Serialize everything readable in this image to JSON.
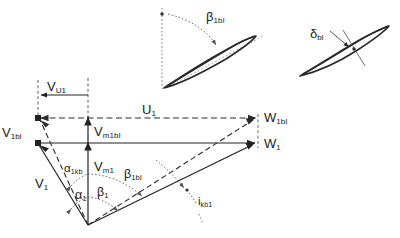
{
  "figure": {
    "colors": {
      "line": "#222222",
      "dashed": "#333333",
      "dotted": "#777777",
      "blade_outline": "#2a2a2a",
      "blade_camber": "#999999",
      "background": "#ffffff"
    }
  },
  "blade_top": {
    "angle_label": {
      "symbol": "β",
      "subscript": "1bl",
      "description": "blade inlet angle measured from meridional reference"
    },
    "reference_line": "vertical-dotted-meridional-line",
    "arc": "dotted-angle-arc",
    "profile": "thin-cambered-blade-profile",
    "camber_line": "dotted-camber-line"
  },
  "blade_right": {
    "thickness_label": {
      "symbol": "δ",
      "subscript": "bl",
      "description": "blade thickness"
    },
    "profile": "thin-cambered-blade-profile",
    "thickness_arrow": "double-headed-thickness-indicator"
  },
  "triangle": {
    "vectors": [
      {
        "name": "V_U1",
        "symbol": "V",
        "subscript": "U1",
        "description": "tangential component of absolute velocity",
        "style": "solid-arrow-left"
      },
      {
        "name": "U_1",
        "symbol": "U",
        "subscript": "1",
        "description": "blade speed at inlet",
        "style": "dashed-double-arrow"
      },
      {
        "name": "V_1bl",
        "symbol": "V",
        "subscript": "1bl",
        "description": "absolute velocity with blade blockage",
        "style": "dashed-arrow"
      },
      {
        "name": "V_1",
        "symbol": "V",
        "subscript": "1",
        "description": "absolute velocity at inlet",
        "style": "solid-arrow"
      },
      {
        "name": "V_m1bl",
        "symbol": "V",
        "subscript": "m1bl",
        "description": "meridional velocity with blade blockage",
        "style": "solid-arrow-up"
      },
      {
        "name": "V_m1",
        "symbol": "V",
        "subscript": "m1",
        "description": "meridional velocity at inlet",
        "style": "solid-arrow-up"
      },
      {
        "name": "W_1bl",
        "symbol": "W",
        "subscript": "1bl",
        "description": "relative velocity with blade blockage",
        "style": "dashed-arrow"
      },
      {
        "name": "W_1",
        "symbol": "W",
        "subscript": "1",
        "description": "relative velocity at inlet",
        "style": "solid-arrow"
      }
    ],
    "angles": [
      {
        "name": "alpha_1kb",
        "symbol": "α",
        "subscript": "1kb",
        "description": "absolute flow angle with blade blockage",
        "arc": "dotted"
      },
      {
        "name": "alpha_1",
        "symbol": "α",
        "subscript": "1",
        "description": "absolute flow angle",
        "arc": "dotted"
      },
      {
        "name": "beta_1",
        "symbol": "β",
        "subscript": "1",
        "description": "relative flow angle",
        "arc": "dotted"
      },
      {
        "name": "beta_1bl",
        "symbol": "β",
        "subscript": "1bl",
        "description": "relative flow angle with blade blockage",
        "arc": "dotted"
      },
      {
        "name": "i_kb1",
        "symbol": "i",
        "subscript": "kb1",
        "description": "incidence angle with blade blockage",
        "arc": "leader-line"
      }
    ]
  }
}
